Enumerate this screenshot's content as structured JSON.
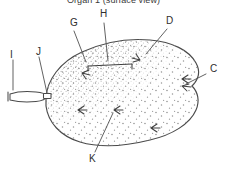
{
  "figure": {
    "title": "Organ 1 (surface view)",
    "colors": {
      "ink": "#3a3a3a",
      "outline": "#4a4a4a",
      "stipple": "#8d8d8d",
      "stipple_dense": "#6a6a6a",
      "background": "#ffffff",
      "label_text": "#2e2e2e"
    },
    "labels": [
      {
        "id": "G",
        "text": "G",
        "x": 70,
        "y": 18
      },
      {
        "id": "H",
        "text": "H",
        "x": 100,
        "y": 10
      },
      {
        "id": "D",
        "text": "D",
        "x": 166,
        "y": 16
      },
      {
        "id": "C",
        "text": "C",
        "x": 210,
        "y": 70
      },
      {
        "id": "I",
        "text": "I",
        "x": 10,
        "y": 52
      },
      {
        "id": "J",
        "text": "J",
        "x": 37,
        "y": 48
      },
      {
        "id": "K",
        "text": "K",
        "x": 90,
        "y": 155
      }
    ],
    "parts": {
      "body_name": "organ-body",
      "stalk_name": "organ-stalk",
      "junction_name": "stalk-junction",
      "stipple_name": "surface-stippling",
      "interior_marks": "surface-arrow-marks"
    },
    "leaders": [
      {
        "label": "G",
        "name": "leader-line-g"
      },
      {
        "label": "H",
        "name": "leader-line-h"
      },
      {
        "label": "D",
        "name": "leader-line-d"
      },
      {
        "label": "C",
        "name": "leader-line-c"
      },
      {
        "label": "I",
        "name": "leader-line-i"
      },
      {
        "label": "J",
        "name": "leader-line-j"
      },
      {
        "label": "K",
        "name": "leader-line-k"
      }
    ]
  }
}
